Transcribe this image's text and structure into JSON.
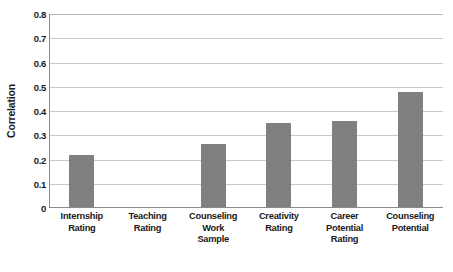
{
  "chart_data": {
    "type": "bar",
    "title": "",
    "xlabel": "",
    "ylabel": "Correlation",
    "ylim": [
      0,
      0.8
    ],
    "ytick_step": 0.1,
    "grid": true,
    "legend": "none",
    "orientation": "vertical",
    "bar_color": "#808080",
    "gridline_color": "#c9c9c9",
    "axis_color": "#8a8a8a",
    "background_color": "#ffffff",
    "categories": [
      "Internship Rating",
      "Teaching Rating",
      "Counseling Work Sample",
      "Creativity Rating",
      "Career Potential Rating",
      "Counseling Potential"
    ],
    "category_lines": [
      [
        "Internship",
        "Rating"
      ],
      [
        "Teaching",
        "Rating"
      ],
      [
        "Counseling",
        "Work",
        "Sample"
      ],
      [
        "Creativity",
        "Rating"
      ],
      [
        "Career",
        "Potential",
        "Rating"
      ],
      [
        "Counseling",
        "Potential"
      ]
    ],
    "values": [
      0.22,
      0,
      0.265,
      0.35,
      0.36,
      0.48
    ],
    "ytick_labels": [
      "0.8",
      "0.7",
      "0.6",
      "0.5",
      "0.4",
      "0.3",
      "0.2",
      "0.1",
      "0"
    ],
    "ytick_values": [
      0.8,
      0.7,
      0.6,
      0.5,
      0.4,
      0.3,
      0.2,
      0.1,
      0
    ]
  }
}
